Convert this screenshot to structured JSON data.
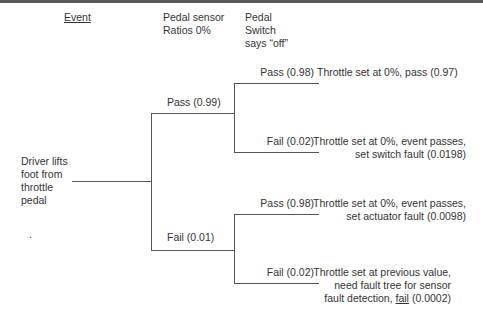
{
  "headers": {
    "event": "Event",
    "pedal_sensor": [
      "Pedal sensor",
      "Ratios 0%"
    ],
    "pedal_switch": [
      "Pedal",
      "Switch",
      "says “off”"
    ]
  },
  "root": {
    "label": [
      "Driver lifts",
      "foot from",
      "throttle",
      "pedal"
    ],
    "dot": "."
  },
  "sensor_branches": {
    "pass": "Pass (0.99)",
    "fail": "Fail (0.01)"
  },
  "switch_branches": {
    "upper_pass": "Pass (0.98)",
    "upper_fail": "Fail (0.02)",
    "lower_pass": "Pass (0.98)",
    "lower_fail": "Fail (0.02)"
  },
  "outcomes": {
    "o1": [
      "Throttle set at 0%, pass (0.97)"
    ],
    "o2": [
      "Throttle set at 0%, event passes,",
      "set switch fault (0.0198)"
    ],
    "o3": [
      "Throttle set at 0%, event passes,",
      "set actuator fault (0.0098)"
    ],
    "o4": {
      "lines": [
        "Throttle set at previous value,",
        "need fault tree for sensor"
      ],
      "last_prefix": "fault detection, ",
      "last_underlined": "fail",
      "last_suffix": " (0.0002)"
    }
  }
}
